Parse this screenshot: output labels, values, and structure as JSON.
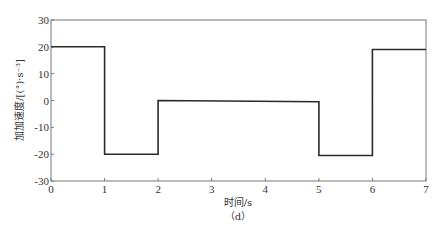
{
  "chart_data": {
    "type": "line",
    "title": "",
    "xlabel": "时间/s",
    "ylabel": "加加速度/[(°)·s⁻³]",
    "caption": "（d）",
    "xlim": [
      0,
      7
    ],
    "ylim": [
      -30,
      30
    ],
    "xticks": [
      0,
      1,
      2,
      3,
      4,
      5,
      6,
      7
    ],
    "yticks": [
      30,
      20,
      10,
      0,
      -10,
      -20,
      -30
    ],
    "grid": false,
    "legend": "none",
    "line_color": "#2a2a2a",
    "series": [
      {
        "name": "jerk",
        "step": true,
        "x": [
          0,
          1,
          1,
          2,
          2,
          5,
          5,
          6,
          6,
          7
        ],
        "y": [
          20,
          20,
          -20,
          -20,
          0,
          -0.5,
          -20.5,
          -20.5,
          19,
          19
        ]
      }
    ]
  }
}
